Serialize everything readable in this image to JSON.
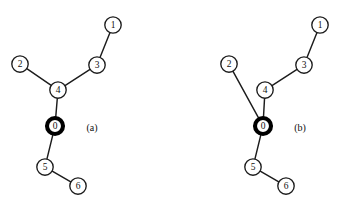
{
  "figure": {
    "background_color": "#ffffff",
    "stroke_color": "#1c1c1c",
    "root_stroke_color": "#000000",
    "node_fill_color": "#ffffff",
    "width": 344,
    "height": 215
  },
  "panels": [
    {
      "caption": "(a)",
      "caption_x": 92,
      "caption_y": 127,
      "nodes": [
        {
          "id": "1",
          "label": "1",
          "x": 113,
          "y": 25,
          "r": 8.2,
          "root": false
        },
        {
          "id": "2",
          "label": "2",
          "x": 20,
          "y": 64,
          "r": 8.2,
          "root": false
        },
        {
          "id": "3",
          "label": "3",
          "x": 97,
          "y": 65,
          "r": 8.2,
          "root": false
        },
        {
          "id": "4",
          "label": "4",
          "x": 58,
          "y": 90,
          "r": 8.2,
          "root": false
        },
        {
          "id": "0",
          "label": "0",
          "x": 55,
          "y": 126,
          "r": 8.0,
          "root": true
        },
        {
          "id": "5",
          "label": "5",
          "x": 45,
          "y": 167,
          "r": 8.2,
          "root": false
        },
        {
          "id": "6",
          "label": "6",
          "x": 78,
          "y": 186,
          "r": 8.2,
          "root": false
        }
      ],
      "edges": [
        {
          "from": "1",
          "to": "3"
        },
        {
          "from": "3",
          "to": "4"
        },
        {
          "from": "2",
          "to": "4"
        },
        {
          "from": "4",
          "to": "0"
        },
        {
          "from": "0",
          "to": "5"
        },
        {
          "from": "5",
          "to": "6"
        }
      ]
    },
    {
      "caption": "(b)",
      "caption_x": 300,
      "caption_y": 127,
      "nodes": [
        {
          "id": "1",
          "label": "1",
          "x": 320,
          "y": 25,
          "r": 8.2,
          "root": false
        },
        {
          "id": "2",
          "label": "2",
          "x": 229,
          "y": 64,
          "r": 8.2,
          "root": false
        },
        {
          "id": "3",
          "label": "3",
          "x": 304,
          "y": 65,
          "r": 8.2,
          "root": false
        },
        {
          "id": "4",
          "label": "4",
          "x": 265,
          "y": 90,
          "r": 8.2,
          "root": false
        },
        {
          "id": "0",
          "label": "0",
          "x": 263,
          "y": 126,
          "r": 8.0,
          "root": true
        },
        {
          "id": "5",
          "label": "5",
          "x": 253,
          "y": 167,
          "r": 8.2,
          "root": false
        },
        {
          "id": "6",
          "label": "6",
          "x": 286,
          "y": 186,
          "r": 8.2,
          "root": false
        }
      ],
      "edges": [
        {
          "from": "1",
          "to": "3"
        },
        {
          "from": "3",
          "to": "4"
        },
        {
          "from": "2",
          "to": "0"
        },
        {
          "from": "4",
          "to": "0"
        },
        {
          "from": "0",
          "to": "5"
        },
        {
          "from": "5",
          "to": "6"
        }
      ]
    }
  ]
}
